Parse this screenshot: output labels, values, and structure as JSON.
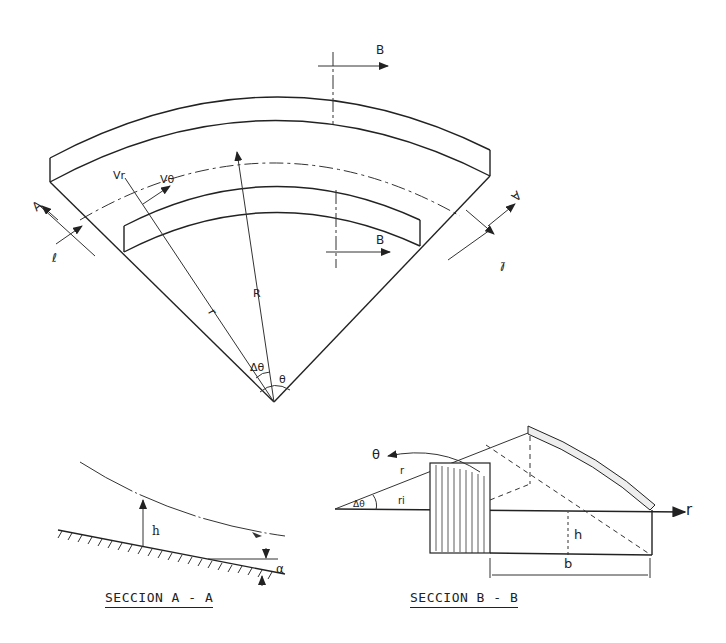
{
  "plan_view": {
    "section_marks": {
      "top": "B",
      "bottom": "B",
      "left": "A",
      "right": "A"
    },
    "centerline_left": "ℓ",
    "centerline_right": "ℓ",
    "velocity_radial": "Vr",
    "velocity_tangential": "Vθ",
    "radius_label": "R",
    "r_label": "r",
    "delta_theta": "Δθ",
    "theta": "θ"
  },
  "section_a": {
    "caption": "SECCION  A - A",
    "depth_label": "h",
    "slope_label": "α",
    "water_surface": "▽"
  },
  "section_b": {
    "caption": "SECCION  B  -  B",
    "theta": "θ",
    "r_label_curve": "r",
    "r_i": "ri",
    "delta_theta": "Δθ",
    "depth_label": "h",
    "width_label": "b",
    "axis_r": "r"
  }
}
